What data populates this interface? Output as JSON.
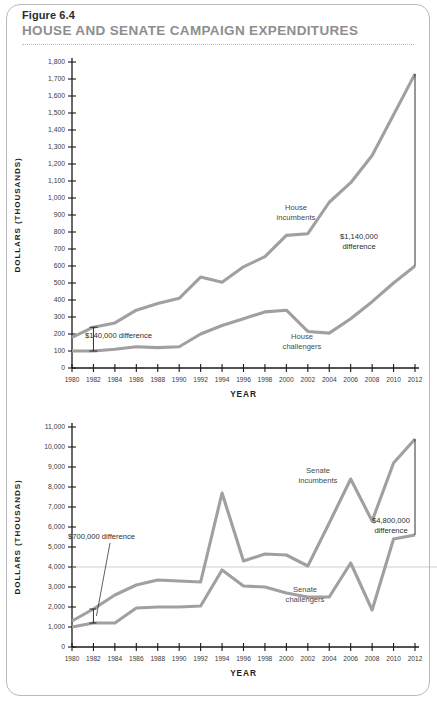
{
  "figure": {
    "number": "Figure 6.4",
    "title": "HOUSE AND SENATE CAMPAIGN EXPENDITURES"
  },
  "chart_data": [
    {
      "type": "line",
      "id": "house",
      "title": "House campaign expenditures",
      "xlabel": "YEAR",
      "ylabel": "DOLLARS (THOUSANDS)",
      "x": [
        1980,
        1982,
        1984,
        1986,
        1988,
        1990,
        1992,
        1994,
        1996,
        1998,
        2000,
        2002,
        2004,
        2006,
        2008,
        2010,
        2012
      ],
      "xlim": [
        1980,
        2012
      ],
      "ylim": [
        0,
        1800
      ],
      "ytick_step": 100,
      "ytick_labels": [
        "0",
        "100",
        "200",
        "300",
        "400",
        "500",
        "600",
        "700",
        "800",
        "900",
        "1,000",
        "1,100",
        "1,200",
        "1,300",
        "1,400",
        "1,500",
        "1,600",
        "1,700",
        "1,800"
      ],
      "xtick_labels": [
        "1980",
        "1982",
        "1984",
        "1986",
        "1988",
        "1990",
        "1992",
        "1994",
        "1996",
        "1998",
        "2000",
        "2002",
        "2004",
        "2006",
        "2008",
        "2010",
        "2012"
      ],
      "grid": false,
      "legend": "inline-labels",
      "series": [
        {
          "name": "House incumbents",
          "values": [
            180,
            240,
            265,
            340,
            380,
            410,
            535,
            505,
            595,
            655,
            780,
            790,
            975,
            1090,
            1250,
            1490,
            1730
          ]
        },
        {
          "name": "House challengers",
          "values": [
            100,
            100,
            110,
            125,
            120,
            125,
            200,
            250,
            290,
            330,
            340,
            215,
            205,
            290,
            390,
            500,
            600
          ]
        }
      ],
      "annotations": [
        {
          "text": "$1,140,000 difference",
          "lines": [
            "$1,140,000",
            "difference"
          ],
          "at_year": 2012
        },
        {
          "text": "$140,000 difference",
          "lines": [
            "$140,000 difference"
          ],
          "at_year": 1982
        },
        {
          "text": "House incumbents",
          "lines": [
            "House",
            "incumbents"
          ]
        },
        {
          "text": "House challengers",
          "lines": [
            "House",
            "challengers"
          ]
        }
      ]
    },
    {
      "type": "line",
      "id": "senate",
      "title": "Senate campaign expenditures",
      "xlabel": "YEAR",
      "ylabel": "DOLLARS (THOUSANDS)",
      "x": [
        1980,
        1982,
        1984,
        1986,
        1988,
        1990,
        1992,
        1994,
        1996,
        1998,
        2000,
        2002,
        2004,
        2006,
        2008,
        2010,
        2012
      ],
      "xlim": [
        1980,
        2012
      ],
      "ylim": [
        0,
        11000
      ],
      "ytick_step": 1000,
      "ytick_labels": [
        "0",
        "1,000",
        "2,000",
        "3,000",
        "4,000",
        "5,000",
        "6,000",
        "7,000",
        "8,000",
        "9,000",
        "10,000",
        "11,000"
      ],
      "xtick_labels": [
        "1980",
        "1982",
        "1984",
        "1986",
        "1988",
        "1990",
        "1992",
        "1994",
        "1996",
        "1998",
        "2000",
        "2002",
        "2004",
        "2006",
        "2008",
        "2010",
        "2012"
      ],
      "grid": false,
      "legend": "inline-labels",
      "series": [
        {
          "name": "Senate incumbents",
          "values": [
            1300,
            1900,
            2600,
            3100,
            3350,
            3300,
            3250,
            7700,
            4300,
            4650,
            4600,
            4050,
            6200,
            8400,
            6300,
            9200,
            10400
          ]
        },
        {
          "name": "Senate challengers",
          "values": [
            1000,
            1200,
            1200,
            1950,
            2000,
            2000,
            2050,
            3850,
            3050,
            3000,
            2700,
            2500,
            2500,
            4200,
            1850,
            5400,
            5600
          ]
        }
      ],
      "annotations": [
        {
          "text": "$700,000 difference",
          "lines": [
            "$700,000 difference"
          ],
          "at_year": 1982
        },
        {
          "text": "$4,800,000 difference",
          "lines": [
            "$4,800,000",
            "difference"
          ],
          "at_year": 2012
        },
        {
          "text": "Senate incumbents",
          "lines": [
            "Senate",
            "incumbents"
          ]
        },
        {
          "text": "Senate challengers",
          "lines": [
            "Senate",
            "challengers"
          ]
        }
      ]
    }
  ]
}
